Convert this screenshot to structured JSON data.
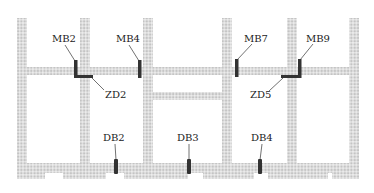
{
  "diagram": {
    "type": "structural plan (wall layout with damper locations)",
    "colors": {
      "wall_fill": "#c8c8c8",
      "wall_grid": "#ffffff",
      "damper": "#333333",
      "leader": "#333333",
      "text": "#222222"
    },
    "labels": {
      "MB2": "MB2",
      "MB4": "MB4",
      "MB7": "MB7",
      "MB9": "MB9",
      "ZD2": "ZD2",
      "ZD5": "ZD5",
      "DB2": "DB2",
      "DB3": "DB3",
      "DB4": "DB4"
    }
  }
}
